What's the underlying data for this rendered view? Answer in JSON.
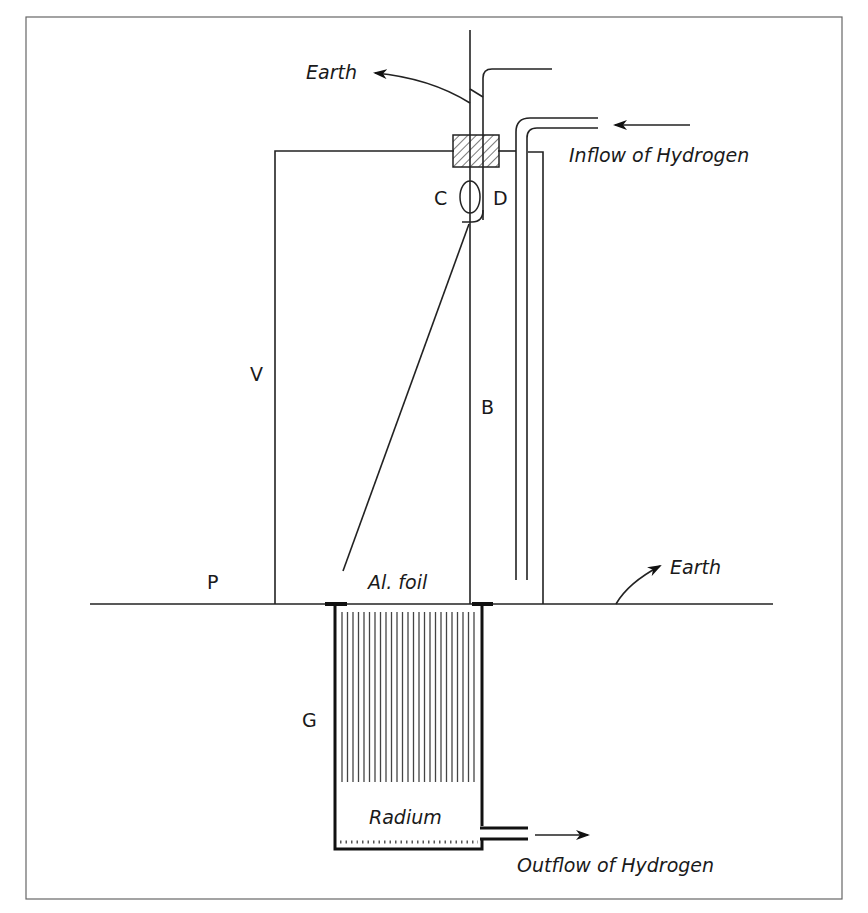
{
  "diagram": {
    "labels": {
      "earth_top": "Earth",
      "earth_right": "Earth",
      "inflow": "Inflow of Hydrogen",
      "outflow": "Outflow of Hydrogen",
      "c": "C",
      "d": "D",
      "v": "V",
      "b": "B",
      "p": "P",
      "g": "G",
      "foil": "Al. foil",
      "radium": "Radium"
    },
    "colors": {
      "line": "#222222",
      "background": "#ffffff",
      "frame": "#555555"
    }
  }
}
